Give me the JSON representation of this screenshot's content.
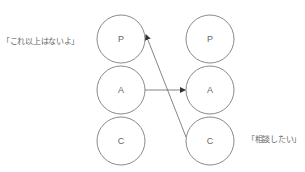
{
  "diagram": {
    "left_column": {
      "nodes": [
        {
          "label": "P"
        },
        {
          "label": "A"
        },
        {
          "label": "C"
        }
      ]
    },
    "right_column": {
      "nodes": [
        {
          "label": "P"
        },
        {
          "label": "A"
        },
        {
          "label": "C"
        }
      ]
    },
    "edges": [
      {
        "from": "left.A",
        "to": "right.A",
        "arrow": "end"
      },
      {
        "from": "right.C",
        "to": "left.P",
        "arrow": "end"
      }
    ],
    "annotations": {
      "left_quote": "「これ以上はないよ」",
      "right_quote": "「相談したい」"
    },
    "colors": {
      "stroke": "#8a8a8a",
      "text": "#666666",
      "background": "#ffffff"
    }
  }
}
